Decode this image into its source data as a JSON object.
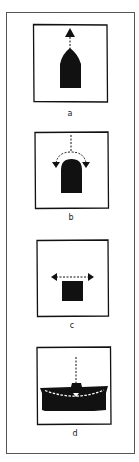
{
  "figure": {
    "colors": {
      "ink": "#111111",
      "frame": "#555555",
      "background": "#ffffff"
    },
    "panels": [
      {
        "id": "a",
        "label": "a",
        "depiction": "pointed shape with dashed arrow pointing up"
      },
      {
        "id": "b",
        "label": "b",
        "depiction": "rounded shape with dashed arc curving to both sides, arrows pointing down"
      },
      {
        "id": "c",
        "label": "c",
        "depiction": "square shape with horizontal dashed double-headed arrow"
      },
      {
        "id": "d",
        "label": "d",
        "depiction": "wide block with dashed vertical line pressing down onto a sagging dashed curve"
      }
    ]
  }
}
